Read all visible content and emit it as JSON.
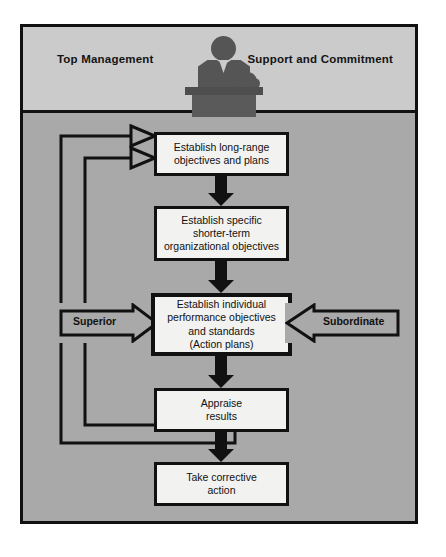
{
  "diagram": {
    "type": "flowchart",
    "header": {
      "left_label": "Top Management",
      "right_label": "Support and Commitment",
      "icon": "manager-at-desk-icon"
    },
    "boxes": [
      {
        "id": "box1",
        "text": "Establish long-range\nobjectives and plans"
      },
      {
        "id": "box2",
        "text": "Establish specific\nshorter-term\norganizational objectives"
      },
      {
        "id": "box3",
        "text": "Establish individual\nperformance objectives\nand standards\n(Action plans)"
      },
      {
        "id": "box4",
        "text": "Appraise\nresults"
      },
      {
        "id": "box5",
        "text": "Take corrective\naction"
      }
    ],
    "side_arrows": {
      "left_label": "Superior",
      "right_label": "Subordinate"
    },
    "colors": {
      "page_background": "#ffffff",
      "header_band": "#cbcbcb",
      "body_background": "#a9a9a9",
      "box_fill": "#f2f2f0",
      "line": "#111111",
      "silhouette": "#555555"
    },
    "feedback_loops": [
      {
        "id": "outer-loop",
        "from": "box5",
        "to": "box1"
      },
      {
        "id": "inner-loop",
        "from": "box5",
        "to": "box1"
      }
    ]
  }
}
